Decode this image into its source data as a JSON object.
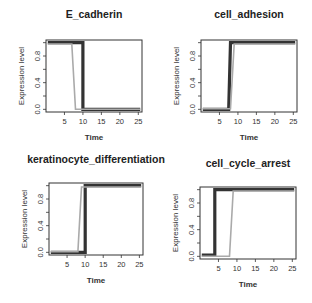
{
  "chart_data": [
    {
      "type": "line",
      "title": "E_cadherin",
      "xlabel": "Time",
      "ylabel": "Expression level",
      "xticks": [
        5,
        10,
        15,
        20,
        25
      ],
      "yticks": [
        0.0,
        0.4,
        0.8
      ],
      "ytick_labels": [
        "0.0",
        "0.4",
        "0.8"
      ],
      "xlim": [
        0,
        26
      ],
      "ylim": [
        -0.04,
        1.04
      ],
      "grid": false,
      "series": [
        {
          "name": "dark",
          "color": "#333333",
          "x": [
            0.5,
            10,
            10,
            25.5
          ],
          "y": [
            1,
            1,
            0,
            0
          ]
        },
        {
          "name": "gray",
          "color": "#aaaaaa",
          "x": [
            0.5,
            7,
            8,
            10,
            25.5
          ],
          "y": [
            0.98,
            0.98,
            0,
            0,
            0
          ]
        }
      ]
    },
    {
      "type": "line",
      "title": "cell_adhesion",
      "xlabel": "Time",
      "ylabel": "Expression level",
      "xticks": [
        5,
        10,
        15,
        20,
        25
      ],
      "yticks": [
        0.0,
        0.4,
        0.8
      ],
      "ytick_labels": [
        "0.0",
        "0.4",
        "0.8"
      ],
      "xlim": [
        0,
        26
      ],
      "ylim": [
        -0.04,
        1.04
      ],
      "grid": false,
      "series": [
        {
          "name": "dark",
          "color": "#333333",
          "x": [
            0.5,
            7.5,
            8,
            25.5
          ],
          "y": [
            0,
            0,
            1,
            1
          ]
        },
        {
          "name": "gray",
          "color": "#aaaaaa",
          "x": [
            0.5,
            8,
            9,
            25.5
          ],
          "y": [
            0.01,
            0.01,
            0.98,
            0.98
          ]
        }
      ]
    },
    {
      "type": "line",
      "title": "keratinocyte_differentiation",
      "xlabel": "Time",
      "ylabel": "Expression level",
      "xticks": [
        5,
        10,
        15,
        20,
        25
      ],
      "yticks": [
        0.0,
        0.4,
        0.8
      ],
      "ytick_labels": [
        "0.0",
        "0.4",
        "0.8"
      ],
      "xlim": [
        0,
        26
      ],
      "ylim": [
        -0.04,
        1.04
      ],
      "grid": false,
      "series": [
        {
          "name": "dark",
          "color": "#333333",
          "x": [
            0.5,
            10,
            10,
            25.5
          ],
          "y": [
            0,
            0,
            1,
            1
          ]
        },
        {
          "name": "gray",
          "color": "#aaaaaa",
          "x": [
            0.5,
            8,
            9,
            25.5
          ],
          "y": [
            0.01,
            0.01,
            0.98,
            0.98
          ]
        }
      ]
    },
    {
      "type": "line",
      "title": "cell_cycle_arrest",
      "xlabel": "Time",
      "ylabel": "Expression level",
      "xticks": [
        5,
        10,
        15,
        20,
        25
      ],
      "yticks": [
        0.0,
        0.4,
        0.8
      ],
      "ytick_labels": [
        "0.0",
        "0.4",
        "0.8"
      ],
      "xlim": [
        0,
        26
      ],
      "ylim": [
        -0.04,
        1.04
      ],
      "grid": false,
      "series": [
        {
          "name": "dark",
          "color": "#333333",
          "x": [
            0.5,
            4,
            4,
            25.5
          ],
          "y": [
            0.02,
            0.02,
            1,
            1
          ]
        },
        {
          "name": "gray",
          "color": "#aaaaaa",
          "x": [
            0.5,
            8,
            9,
            25.5
          ],
          "y": [
            0,
            0,
            0.98,
            0.98
          ]
        }
      ]
    }
  ]
}
